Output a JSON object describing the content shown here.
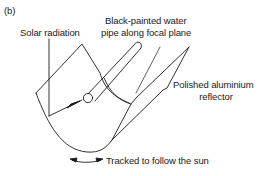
{
  "figure": {
    "panel_label": "(b)",
    "labels": {
      "solar_radiation": "Solar radiation",
      "pipe_line1": "Black-painted water",
      "pipe_line2": "pipe along focal plane",
      "reflector_line1": "Polished aluminium",
      "reflector_line2": "reflector",
      "tracking": "Tracked to follow the sun"
    },
    "colors": {
      "stroke": "#1a1a1a",
      "background": "#ffffff"
    }
  }
}
